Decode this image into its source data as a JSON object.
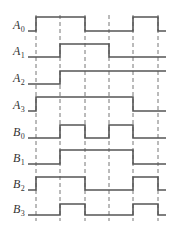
{
  "diagram": {
    "type": "timing-diagram",
    "colors": {
      "waveform": "#555555",
      "dashes": "#777777",
      "label": "#333333"
    },
    "x_start": 28,
    "x_end": 166,
    "time_marks": [
      36,
      60,
      85,
      109,
      133,
      158
    ],
    "signals": [
      {
        "name": "A",
        "sub": "0",
        "high_y": 17,
        "low_y": 31,
        "levels": [
          0,
          1,
          1,
          0,
          0,
          1,
          0
        ]
      },
      {
        "name": "A",
        "sub": "1",
        "high_y": 44,
        "low_y": 57,
        "levels": [
          0,
          0,
          1,
          1,
          0,
          0,
          0
        ]
      },
      {
        "name": "A",
        "sub": "2",
        "high_y": 71,
        "low_y": 84,
        "levels": [
          0,
          0,
          1,
          1,
          1,
          1,
          1
        ]
      },
      {
        "name": "A",
        "sub": "3",
        "high_y": 97,
        "low_y": 111,
        "levels": [
          0,
          1,
          1,
          1,
          1,
          0,
          0
        ]
      },
      {
        "name": "B",
        "sub": "0",
        "high_y": 125,
        "low_y": 138,
        "levels": [
          0,
          0,
          1,
          0,
          1,
          0,
          0
        ]
      },
      {
        "name": "B",
        "sub": "1",
        "high_y": 150,
        "low_y": 164,
        "levels": [
          0,
          0,
          1,
          1,
          1,
          0,
          0
        ]
      },
      {
        "name": "B",
        "sub": "2",
        "high_y": 177,
        "low_y": 190,
        "levels": [
          0,
          1,
          1,
          0,
          0,
          1,
          0
        ]
      },
      {
        "name": "B",
        "sub": "3",
        "high_y": 204,
        "low_y": 215,
        "levels": [
          0,
          0,
          1,
          0,
          0,
          1,
          0
        ]
      }
    ]
  }
}
